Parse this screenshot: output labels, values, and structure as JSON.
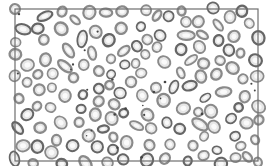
{
  "image": {
    "subject": "Peripheral blood smear micrograph showing red blood cells",
    "colors": {
      "background": "#ffffff",
      "frame": "#6e6e6e",
      "cell_ring": "#8a8a8a",
      "cell_ring_dark": "#666666",
      "cell_center": "#e6e6e6",
      "platelet": "#444444"
    },
    "cell_count_approx": 150
  }
}
